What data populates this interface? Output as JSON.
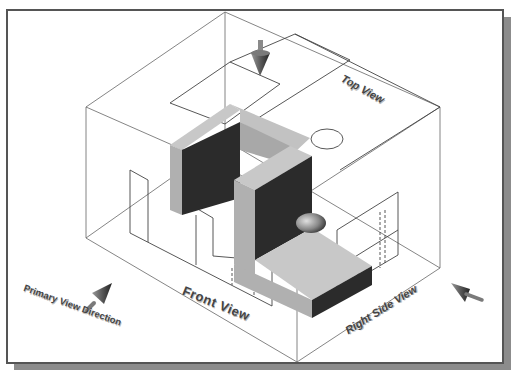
{
  "figure": {
    "type": "glass-box orthographic projection illustration",
    "labels": {
      "top_view": "Top View",
      "front_view": "Front View",
      "right_side_view": "Right Side View",
      "primary_view_direction": "Primary View Direction"
    },
    "arrows": [
      {
        "name": "top-view-arrow",
        "direction": "down"
      },
      {
        "name": "primary-view-arrow",
        "direction": "up-right"
      },
      {
        "name": "right-view-arrow",
        "direction": "up-left"
      }
    ],
    "colors": {
      "frame_border": "#555555",
      "frame_shadow": "#8c8c8c",
      "box_lines": "#666666",
      "object_light_face": "#c8c8c8",
      "object_mid_face": "#a8a8a8",
      "object_dark_face": "#2b2b2b",
      "label_text": "#444444"
    }
  }
}
